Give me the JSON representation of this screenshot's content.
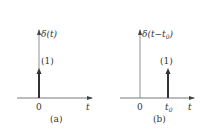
{
  "panels": [
    {
      "id": "a",
      "function_label": "δ(t)",
      "weight_label": "(1)",
      "origin_label": "0",
      "axis_label": "t",
      "caption": "(a)",
      "impulse_location": "0"
    },
    {
      "id": "b",
      "function_label_prefix": "δ(t−t",
      "function_label_sub": "0",
      "function_label_suffix": ")",
      "weight_label": "(1)",
      "origin_label": "0",
      "shift_label_main": "t",
      "shift_label_sub": "0",
      "axis_label": "t",
      "caption": "(b)",
      "impulse_location": "t0"
    }
  ]
}
